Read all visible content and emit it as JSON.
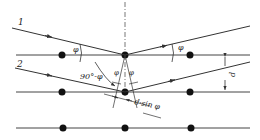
{
  "diagram": {
    "ray_labels": [
      "1",
      "2"
    ],
    "angle_label": "φ",
    "complement_angle_label": "90°-φ",
    "spacing_label": "d",
    "path_difference_label": "d·sin φ",
    "colors": {
      "line": "#333333",
      "atom": "#111111",
      "background": "#ffffff"
    },
    "lattice_planes": [
      {
        "y": 55,
        "atoms_x": [
          62,
          125,
          190
        ]
      },
      {
        "y": 92,
        "atoms_x": [
          62,
          125,
          190
        ]
      },
      {
        "y": 128,
        "atoms_x": [
          63,
          125,
          191
        ]
      }
    ]
  }
}
